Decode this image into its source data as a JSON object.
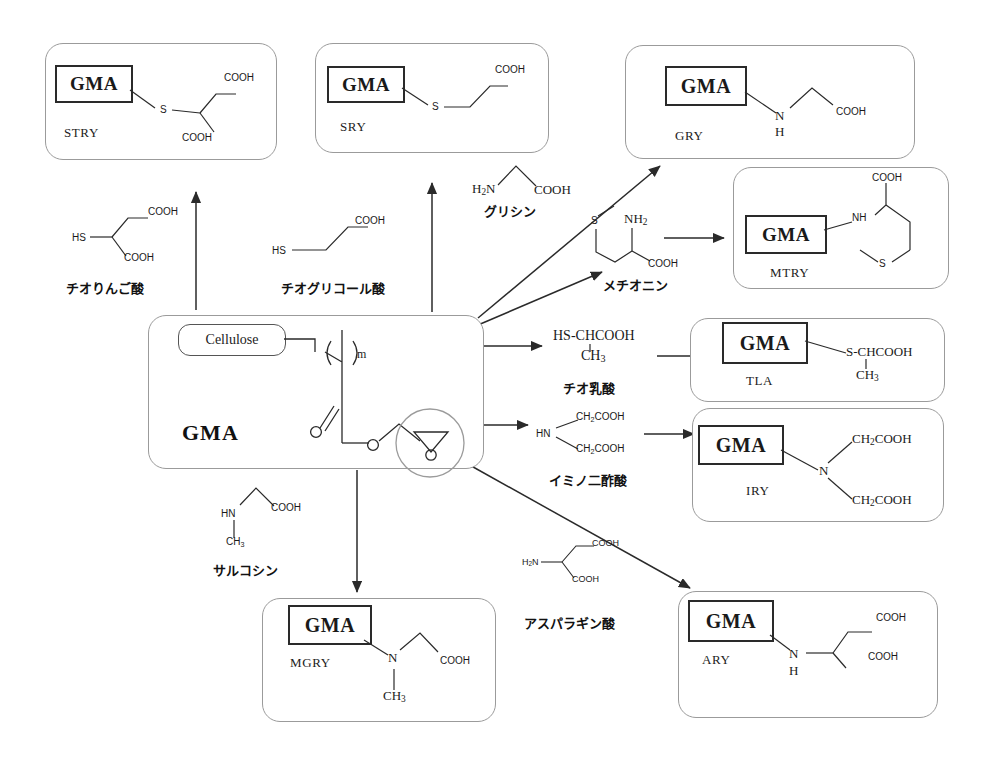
{
  "diagram": {
    "center": {
      "polymer_label": "GMA",
      "backbone_chip": "Cellulose",
      "repeat_subscript": "m",
      "epoxide_atom": "O"
    },
    "reagents": [
      {
        "id": "thiomalic-acid",
        "name": "チオりんご酸",
        "formula_parts": [
          "HS",
          "COOH",
          "COOH"
        ]
      },
      {
        "id": "thioglycolic-acid",
        "name": "チオグリコール酸",
        "formula_parts": [
          "HS",
          "COOH"
        ]
      },
      {
        "id": "glycine",
        "name": "グリシン",
        "formula_parts": [
          "H2N",
          "COOH"
        ]
      },
      {
        "id": "methionine",
        "name": "メチオニン",
        "formula_parts": [
          "S",
          "NH2",
          "COOH"
        ]
      },
      {
        "id": "thiolactic-acid",
        "name": "チオ乳酸",
        "formula_parts": [
          "HS-CHCOOH",
          "CH3"
        ]
      },
      {
        "id": "iminodiacetic-acid",
        "name": "イミノ二酢酸",
        "formula_parts": [
          "HN",
          "CH2COOH",
          "CH2COOH"
        ]
      },
      {
        "id": "sarcosine",
        "name": "サルコシン",
        "formula_parts": [
          "HN",
          "COOH",
          "CH3"
        ]
      },
      {
        "id": "aspartic-acid",
        "name": "アスパラギン酸",
        "formula_parts": [
          "H2N",
          "COOH",
          "COOH"
        ]
      }
    ],
    "products": [
      {
        "id": "stry",
        "code": "STRY",
        "chip": "GMA",
        "atoms": [
          "S",
          "COOH",
          "COOH"
        ],
        "reagent": "thiomalic-acid"
      },
      {
        "id": "sry",
        "code": "SRY",
        "chip": "GMA",
        "atoms": [
          "S",
          "COOH"
        ],
        "reagent": "thioglycolic-acid"
      },
      {
        "id": "gry",
        "code": "GRY",
        "chip": "GMA",
        "atoms": [
          "N",
          "H",
          "COOH"
        ],
        "reagent": "glycine"
      },
      {
        "id": "mtry",
        "code": "MTRY",
        "chip": "GMA",
        "atoms": [
          "NH",
          "COOH",
          "S"
        ],
        "reagent": "methionine"
      },
      {
        "id": "tla",
        "code": "TLA",
        "chip": "GMA",
        "atoms": [
          "S-CHCOOH",
          "CH3"
        ],
        "reagent": "thiolactic-acid"
      },
      {
        "id": "iry",
        "code": "IRY",
        "chip": "GMA",
        "atoms": [
          "N",
          "CH2COOH",
          "CH2COOH"
        ],
        "reagent": "iminodiacetic-acid"
      },
      {
        "id": "mgry",
        "code": "MGRY",
        "chip": "GMA",
        "atoms": [
          "N",
          "COOH",
          "CH3"
        ],
        "reagent": "sarcosine"
      },
      {
        "id": "ary",
        "code": "ARY",
        "chip": "GMA",
        "atoms": [
          "N",
          "H",
          "COOH",
          "COOH"
        ],
        "reagent": "aspartic-acid"
      }
    ],
    "colors": {
      "stroke": "#2a2a2a",
      "box_border": "#9b9b9b",
      "background": "#ffffff",
      "text": "#1a1a1a"
    }
  }
}
